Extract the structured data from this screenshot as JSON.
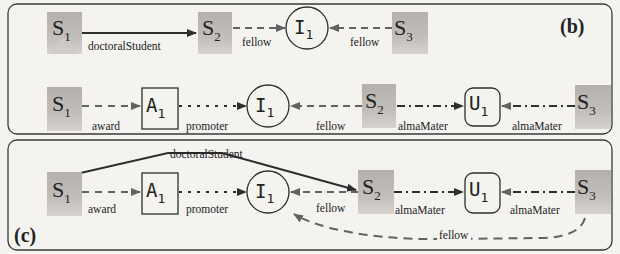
{
  "panels": {
    "b": {
      "label": "(b)",
      "row1": {
        "nodes": {
          "s1": {
            "name": "S",
            "sub": "1",
            "type": "person"
          },
          "s2": {
            "name": "S",
            "sub": "2",
            "type": "person"
          },
          "i1": {
            "name": "I",
            "sub": "1",
            "type": "circle"
          },
          "s3": {
            "name": "S",
            "sub": "3",
            "type": "person"
          }
        },
        "edges": [
          {
            "from": "S1",
            "to": "S2",
            "label": "doctoralStudent",
            "style": "solid"
          },
          {
            "from": "S2",
            "to": "I1",
            "label": "fellow",
            "style": "dashed"
          },
          {
            "from": "S3",
            "to": "I1",
            "label": "fellow",
            "style": "dashed"
          }
        ]
      },
      "row2": {
        "nodes": {
          "s1": {
            "name": "S",
            "sub": "1",
            "type": "person"
          },
          "a1": {
            "name": "A",
            "sub": "1",
            "type": "square"
          },
          "i1": {
            "name": "I",
            "sub": "1",
            "type": "circle"
          },
          "s2": {
            "name": "S",
            "sub": "2",
            "type": "person"
          },
          "u1": {
            "name": "U",
            "sub": "1",
            "type": "rounded"
          },
          "s3": {
            "name": "S",
            "sub": "3",
            "type": "person"
          }
        },
        "edges": [
          {
            "from": "S1",
            "to": "A1",
            "label": "award",
            "style": "dashed"
          },
          {
            "from": "A1",
            "to": "I1",
            "label": "promoter",
            "style": "dotted"
          },
          {
            "from": "S2",
            "to": "I1",
            "label": "fellow",
            "style": "dashed"
          },
          {
            "from": "S2",
            "to": "U1",
            "label": "almaMater",
            "style": "dash-dot"
          },
          {
            "from": "S3",
            "to": "U1",
            "label": "almaMater",
            "style": "dash-dot"
          }
        ]
      }
    },
    "c": {
      "label": "(c)",
      "nodes": {
        "s1": {
          "name": "S",
          "sub": "1",
          "type": "person"
        },
        "a1": {
          "name": "A",
          "sub": "1",
          "type": "square"
        },
        "i1": {
          "name": "I",
          "sub": "1",
          "type": "circle"
        },
        "s2": {
          "name": "S",
          "sub": "2",
          "type": "person"
        },
        "u1": {
          "name": "U",
          "sub": "1",
          "type": "rounded"
        },
        "s3": {
          "name": "S",
          "sub": "3",
          "type": "person"
        }
      },
      "edges": [
        {
          "from": "S1",
          "to": "S2",
          "label": "doctoralStudent",
          "style": "solid"
        },
        {
          "from": "S1",
          "to": "A1",
          "label": "award",
          "style": "dashed"
        },
        {
          "from": "A1",
          "to": "I1",
          "label": "promoter",
          "style": "dotted"
        },
        {
          "from": "S2",
          "to": "I1",
          "label": "fellow",
          "style": "dashed"
        },
        {
          "from": "S2",
          "to": "U1",
          "label": "almaMater",
          "style": "dash-dot"
        },
        {
          "from": "S3",
          "to": "U1",
          "label": "almaMater",
          "style": "dash-dot"
        },
        {
          "from": "S3",
          "to": "I1",
          "label": "fellow",
          "style": "dashed-curve"
        }
      ]
    }
  },
  "colors": {
    "background": "#f4f3f0",
    "border": "#3a3a3a",
    "person_fill": "#b9b6b1",
    "person_light": "#d8d6d2",
    "edge_solid": "#333333",
    "edge_gray": "#666666"
  }
}
